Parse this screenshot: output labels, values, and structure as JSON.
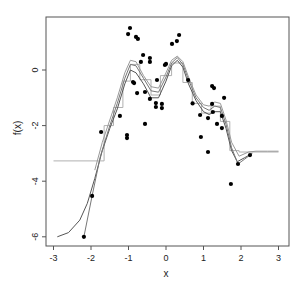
{
  "chart_data": {
    "type": "scatter",
    "title": "",
    "xlabel": "x",
    "ylabel": "f(x)",
    "xlim": [
      -3.3,
      3.3
    ],
    "ylim": [
      -6.3,
      1.9
    ],
    "xticks": [
      -3,
      -2,
      -1,
      0,
      1,
      2,
      3
    ],
    "xtick_labels": [
      "-3",
      "-2",
      "-1",
      "0",
      "1",
      "2",
      "3"
    ],
    "yticks": [
      0,
      -2,
      -4,
      -6
    ],
    "ytick_labels": [
      "0",
      "-2",
      "-4",
      "-6"
    ],
    "grid": false,
    "legend": null,
    "points": {
      "x": [
        -2.19,
        -1.97,
        -1.73,
        -1.23,
        -1.04,
        -1.04,
        -1.01,
        -0.96,
        -0.88,
        -0.85,
        -0.8,
        -0.77,
        -0.75,
        -0.67,
        -0.61,
        -0.56,
        -0.56,
        -0.43,
        -0.43,
        -0.43,
        -0.27,
        -0.27,
        -0.24,
        -0.11,
        -0.11,
        -0.03,
        0.0,
        0.16,
        0.29,
        0.35,
        0.59,
        0.71,
        0.91,
        0.93,
        1.12,
        1.12,
        1.23,
        1.23,
        1.25,
        1.28,
        1.36,
        1.49,
        1.49,
        1.55,
        1.73,
        1.92,
        2.24
      ],
      "y": [
        -6.0,
        -4.53,
        -2.23,
        -1.65,
        -2.34,
        -2.45,
        1.29,
        1.51,
        -0.43,
        -0.47,
        1.19,
        -0.83,
        1.12,
        0.29,
        0.54,
        -0.79,
        -1.94,
        0.43,
        0.29,
        -1.04,
        -1.19,
        -1.33,
        -0.36,
        -1.22,
        -1.37,
        0.18,
        0.22,
        0.94,
        1.04,
        1.26,
        -0.36,
        -1.2,
        -1.62,
        -2.41,
        -1.73,
        -2.95,
        -0.58,
        -1.22,
        -1.51,
        -0.65,
        -1.94,
        -1.65,
        -2.09,
        -1.0,
        -4.1,
        -3.38,
        -3.06
      ]
    },
    "series": [
      {
        "name": "step-fit",
        "style": "step",
        "color": "#b0b0b0",
        "x": [
          -3.0,
          -1.65,
          -1.65,
          -1.4,
          -1.4,
          -1.15,
          -1.15,
          -0.95,
          -0.95,
          -0.7,
          -0.7,
          -0.4,
          -0.4,
          -0.15,
          -0.15,
          0.15,
          0.15,
          0.45,
          0.45,
          0.7,
          0.7,
          0.95,
          0.95,
          1.2,
          1.2,
          1.45,
          1.45,
          1.7,
          1.7,
          1.95,
          1.95,
          3.0
        ],
        "y": [
          -3.27,
          -3.27,
          -2.0,
          -2.0,
          -1.35,
          -1.35,
          -0.4,
          -0.4,
          0.2,
          0.2,
          -0.35,
          -0.35,
          -0.9,
          -0.9,
          -0.2,
          -0.2,
          0.25,
          0.25,
          -0.45,
          -0.45,
          -1.2,
          -1.2,
          -1.55,
          -1.55,
          -1.3,
          -1.3,
          -1.85,
          -1.85,
          -2.9,
          -2.9,
          -2.95,
          -2.95
        ]
      },
      {
        "name": "smooth-fit-1",
        "style": "line",
        "color": "#555555",
        "x": [
          -2.9,
          -2.6,
          -2.3,
          -2.1,
          -1.9,
          -1.7,
          -1.5,
          -1.3,
          -1.1,
          -0.95,
          -0.8,
          -0.6,
          -0.4,
          -0.2,
          0.0,
          0.15,
          0.3,
          0.45,
          0.6,
          0.8,
          1.0,
          1.15,
          1.3,
          1.45,
          1.6,
          1.75,
          1.9,
          2.1,
          2.3
        ],
        "y": [
          -6.0,
          -5.85,
          -5.4,
          -4.8,
          -3.9,
          -2.9,
          -2.1,
          -1.4,
          -0.5,
          0.0,
          -0.1,
          -0.5,
          -1.0,
          -1.0,
          -0.4,
          0.15,
          0.35,
          0.1,
          -0.5,
          -1.1,
          -1.5,
          -1.6,
          -1.5,
          -1.5,
          -2.1,
          -2.9,
          -3.3,
          -3.15,
          -3.0
        ]
      },
      {
        "name": "smooth-fit-2",
        "style": "line",
        "color": "#777777",
        "x": [
          -2.19,
          -1.97,
          -1.75,
          -1.5,
          -1.3,
          -1.1,
          -0.95,
          -0.8,
          -0.6,
          -0.4,
          -0.2,
          0.0,
          0.15,
          0.3,
          0.45,
          0.6,
          0.8,
          1.0,
          1.15,
          1.3,
          1.45,
          1.6,
          1.75,
          1.92,
          2.1,
          2.24
        ],
        "y": [
          -6.0,
          -4.53,
          -3.1,
          -2.0,
          -1.2,
          -0.3,
          0.2,
          0.15,
          -0.3,
          -0.75,
          -0.8,
          -0.25,
          0.25,
          0.45,
          0.2,
          -0.35,
          -1.0,
          -1.35,
          -1.45,
          -1.3,
          -1.35,
          -1.95,
          -2.8,
          -3.38,
          -3.2,
          -3.06
        ]
      },
      {
        "name": "smooth-fit-3",
        "style": "line",
        "color": "#999999",
        "x": [
          -1.9,
          -1.7,
          -1.5,
          -1.3,
          -1.1,
          -0.95,
          -0.8,
          -0.6,
          -0.4,
          -0.2,
          0.0,
          0.15,
          0.3,
          0.45,
          0.6,
          0.8,
          1.0,
          1.15,
          1.3,
          1.45,
          1.6,
          1.75,
          1.95,
          2.2,
          2.4,
          2.7,
          3.0
        ],
        "y": [
          -3.6,
          -2.6,
          -1.8,
          -1.0,
          -0.1,
          0.35,
          0.3,
          -0.2,
          -0.6,
          -0.65,
          -0.1,
          0.35,
          0.5,
          0.3,
          -0.25,
          -0.9,
          -1.25,
          -1.3,
          -1.15,
          -1.2,
          -1.8,
          -2.6,
          -3.1,
          -2.95,
          -2.92,
          -2.92,
          -2.92
        ]
      }
    ]
  },
  "layout": {
    "plot_px": {
      "left": 46,
      "top": 17,
      "right": 289,
      "bottom": 246
    },
    "x_px": {
      "origin": 166,
      "per_unit": 37.5
    },
    "y_px": {
      "origin": 70,
      "per_unit": 27.8
    }
  }
}
